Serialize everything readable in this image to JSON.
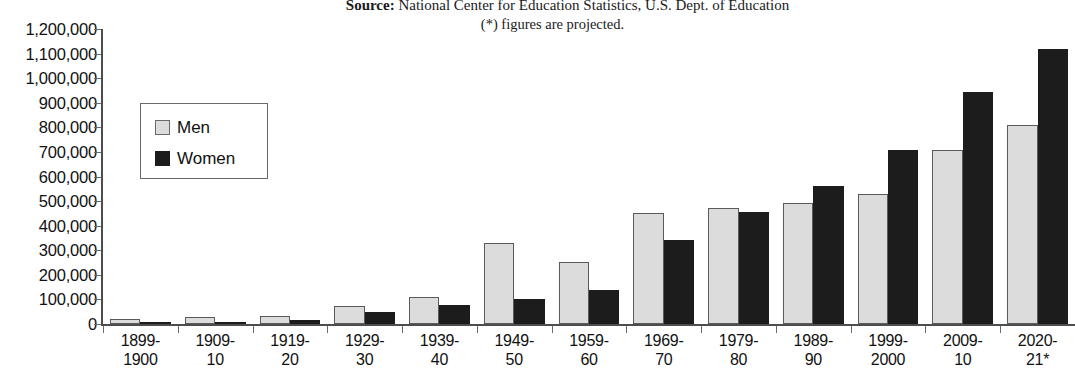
{
  "header": {
    "source_label": "Source:",
    "source_text": " National Center for Education Statistics, U.S. Dept. of Education",
    "projection_note": "(*) figures are projected."
  },
  "legend": {
    "items": [
      {
        "label": "Men",
        "color": "#dcdcdc"
      },
      {
        "label": "Women",
        "color": "#1c1c1c"
      }
    ]
  },
  "chart_data": {
    "type": "bar",
    "title": "",
    "subtitle": "",
    "xlabel": "",
    "ylabel": "",
    "ylim": [
      0,
      1200000
    ],
    "ytick_step": 100000,
    "grid": false,
    "legend_position": "inside-left",
    "categories": [
      "1899-\n1900",
      "1909-\n10",
      "1919-\n20",
      "1929-\n30",
      "1939-\n40",
      "1949-\n50",
      "1959-\n60",
      "1969-\n70",
      "1979-\n80",
      "1989-\n90",
      "1999-\n2000",
      "2009-\n10",
      "2020-\n21*"
    ],
    "category_lines": [
      [
        "1899-",
        "1900"
      ],
      [
        "1909-",
        "10"
      ],
      [
        "1919-",
        "20"
      ],
      [
        "1929-",
        "30"
      ],
      [
        "1939-",
        "40"
      ],
      [
        "1949-",
        "50"
      ],
      [
        "1959-",
        "60"
      ],
      [
        "1969-",
        "70"
      ],
      [
        "1979-",
        "80"
      ],
      [
        "1989-",
        "90"
      ],
      [
        "1999-",
        "2000"
      ],
      [
        "2009-",
        "10"
      ],
      [
        "2020-",
        "21*"
      ]
    ],
    "ytick_labels": [
      "1,200,000",
      "1,100,000",
      "1,000,000",
      "900,000",
      "800,000",
      "700,000",
      "600,000",
      "500,000",
      "400,000",
      "300,000",
      "200,000",
      "100,000",
      "0"
    ],
    "ytick_values": [
      1200000,
      1100000,
      1000000,
      900000,
      800000,
      700000,
      600000,
      500000,
      400000,
      300000,
      200000,
      100000,
      0
    ],
    "series": [
      {
        "name": "Men",
        "color": "#dcdcdc",
        "values": [
          22173,
          28762,
          31980,
          73615,
          109546,
          328841,
          254063,
          451097,
          473611,
          491696,
          530367,
          706660,
          808000
        ]
      },
      {
        "name": "Women",
        "color": "#1c1c1c",
        "values": [
          5237,
          8437,
          16642,
          48869,
          76954,
          103217,
          138377,
          343060,
          455806,
          559648,
          707508,
          943381,
          1118000
        ]
      }
    ]
  }
}
